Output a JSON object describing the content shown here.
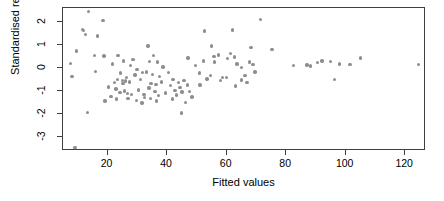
{
  "chart_data": {
    "type": "scatter",
    "title": "",
    "xlabel": "Fitted values",
    "ylabel": "Standardised residuals",
    "xlim": [
      5,
      127
    ],
    "ylim": [
      -3.6,
      2.6
    ],
    "xticks": [
      20,
      40,
      60,
      80,
      100,
      120
    ],
    "yticks": [
      2,
      1,
      0,
      -1,
      -2,
      -3
    ],
    "xtick_labels": [
      "20",
      "40",
      "60",
      "80",
      "100",
      "120"
    ],
    "ytick_labels": [
      "2",
      "1",
      "0",
      "-1",
      "-2",
      "-3"
    ],
    "grid": false,
    "legend": null,
    "point_color": "#8e8e8e",
    "axis_color": "#3f3f3f",
    "background": "#ffffff",
    "series": [
      {
        "name": "residuals",
        "points": [
          [
            13.5,
            2.45
          ],
          [
            18.5,
            2.07
          ],
          [
            11.5,
            1.68
          ],
          [
            11.8,
            1.62
          ],
          [
            12.6,
            1.45
          ],
          [
            16.6,
            1.39
          ],
          [
            9.5,
            0.74
          ],
          [
            15.6,
            0.54
          ],
          [
            18.8,
            0.52
          ],
          [
            7.5,
            0.19
          ],
          [
            8.0,
            -0.36
          ],
          [
            16.0,
            -0.15
          ],
          [
            21.7,
            0.18
          ],
          [
            23.5,
            0.54
          ],
          [
            25.3,
            0.3
          ],
          [
            28.5,
            0.36
          ],
          [
            27.6,
            0.11
          ],
          [
            29.9,
            -0.07
          ],
          [
            24.3,
            -0.22
          ],
          [
            26.3,
            -0.41
          ],
          [
            23.3,
            -0.5
          ],
          [
            24.9,
            -0.55
          ],
          [
            26.1,
            -0.57
          ],
          [
            22.4,
            -0.64
          ],
          [
            25.1,
            -0.66
          ],
          [
            27.3,
            -0.6
          ],
          [
            29.2,
            -0.31
          ],
          [
            31.8,
            -0.19
          ],
          [
            20.2,
            -0.83
          ],
          [
            22.8,
            -0.92
          ],
          [
            25.6,
            -1.0
          ],
          [
            24.1,
            -1.07
          ],
          [
            26.6,
            -1.1
          ],
          [
            28.0,
            -1.16
          ],
          [
            21.1,
            -1.24
          ],
          [
            23.0,
            -1.35
          ],
          [
            26.9,
            -1.33
          ],
          [
            29.6,
            -1.4
          ],
          [
            32.4,
            -1.28
          ],
          [
            19.1,
            -1.44
          ],
          [
            13.2,
            -1.92
          ],
          [
            9.0,
            -3.45
          ],
          [
            33.6,
            0.95
          ],
          [
            35.5,
            0.55
          ],
          [
            34.1,
            0.28
          ],
          [
            36.8,
            0.26
          ],
          [
            38.6,
            0.04
          ],
          [
            33.0,
            -0.18
          ],
          [
            35.1,
            -0.29
          ],
          [
            37.4,
            -0.37
          ],
          [
            31.0,
            -0.5
          ],
          [
            34.6,
            -0.66
          ],
          [
            36.2,
            -0.71
          ],
          [
            38.1,
            -0.61
          ],
          [
            33.9,
            -0.86
          ],
          [
            30.4,
            -0.95
          ],
          [
            35.9,
            -1.03
          ],
          [
            32.2,
            -1.14
          ],
          [
            37.0,
            -1.2
          ],
          [
            39.4,
            -1.09
          ],
          [
            34.4,
            -1.32
          ],
          [
            36.5,
            -1.43
          ],
          [
            31.6,
            -1.52
          ],
          [
            40.5,
            -0.2
          ],
          [
            42.0,
            -0.5
          ],
          [
            43.8,
            -0.62
          ],
          [
            45.6,
            -0.55
          ],
          [
            41.2,
            -0.77
          ],
          [
            44.3,
            -0.84
          ],
          [
            46.8,
            -0.73
          ],
          [
            42.6,
            -0.98
          ],
          [
            45.0,
            -1.05
          ],
          [
            47.5,
            -1.01
          ],
          [
            43.1,
            -1.18
          ],
          [
            48.3,
            -1.26
          ],
          [
            41.8,
            -1.35
          ],
          [
            46.2,
            -1.51
          ],
          [
            44.8,
            -1.95
          ],
          [
            47.0,
            0.43
          ],
          [
            49.5,
            0.11
          ],
          [
            52.2,
            0.31
          ],
          [
            50.8,
            -0.21
          ],
          [
            53.4,
            -0.47
          ],
          [
            51.0,
            -0.73
          ],
          [
            54.6,
            -0.32
          ],
          [
            55.8,
            0.5
          ],
          [
            57.3,
            0.56
          ],
          [
            56.0,
            0.26
          ],
          [
            58.6,
            -0.4
          ],
          [
            59.9,
            -0.41
          ],
          [
            57.9,
            -0.55
          ],
          [
            61.2,
            0.62
          ],
          [
            62.7,
            0.48
          ],
          [
            60.3,
            0.4
          ],
          [
            63.5,
            0.18
          ],
          [
            64.9,
            0.02
          ],
          [
            66.2,
            -0.32
          ],
          [
            65.0,
            -0.52
          ],
          [
            63.0,
            -0.78
          ],
          [
            67.6,
            0.26
          ],
          [
            68.9,
            0.14
          ],
          [
            69.5,
            -0.18
          ],
          [
            66.9,
            -0.63
          ],
          [
            71.4,
            2.11
          ],
          [
            62.0,
            1.65
          ],
          [
            52.6,
            1.6
          ],
          [
            55.0,
            0.96
          ],
          [
            68.2,
            0.88
          ],
          [
            75.3,
            0.79
          ],
          [
            82.5,
            0.12
          ],
          [
            87.0,
            0.13
          ],
          [
            88.2,
            0.08
          ],
          [
            90.5,
            0.25
          ],
          [
            92.1,
            0.3
          ],
          [
            94.8,
            0.27
          ],
          [
            96.3,
            -0.5
          ],
          [
            98.0,
            0.18
          ],
          [
            101.5,
            0.16
          ],
          [
            105.0,
            0.44
          ],
          [
            124.5,
            0.15
          ]
        ]
      }
    ]
  },
  "axes": {
    "x_title": "Fitted values",
    "y_title": "Standardised residuals"
  }
}
